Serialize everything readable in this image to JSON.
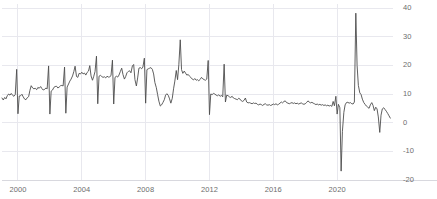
{
  "chart_data": {
    "type": "line",
    "title": "",
    "subtitle": "",
    "xlabel": "",
    "ylabel": "",
    "grid": true,
    "legend": false,
    "legend_position": "none",
    "line_color": "#4d4d4d",
    "grid_color": "#e8e8ee",
    "axis_color": "#d8d8de",
    "background_color": "#ffffff",
    "tick_label_color": "#6d6d6d",
    "ylim": [
      -20,
      40
    ],
    "yticks": [
      -20,
      -10,
      0,
      10,
      20,
      30,
      40
    ],
    "ytick_labels": [
      "-20",
      "-10",
      "0",
      "10",
      "20",
      "30",
      "40"
    ],
    "xlim": [
      1999.0,
      2023.5
    ],
    "xticks": [
      2000,
      2004,
      2008,
      2012,
      2016,
      2020
    ],
    "xtick_labels": [
      "2000",
      "2004",
      "2008",
      "2012",
      "2016",
      "2020"
    ],
    "series": [
      {
        "name": "series-1",
        "x": [
          1999.0,
          1999.08,
          1999.17,
          1999.25,
          1999.33,
          1999.42,
          1999.5,
          1999.58,
          1999.67,
          1999.75,
          1999.83,
          1999.92,
          2000.0,
          2000.08,
          2000.17,
          2000.25,
          2000.33,
          2000.42,
          2000.5,
          2000.58,
          2000.67,
          2000.75,
          2000.83,
          2000.92,
          2001.0,
          2001.08,
          2001.17,
          2001.25,
          2001.33,
          2001.42,
          2001.5,
          2001.58,
          2001.67,
          2001.75,
          2001.83,
          2001.92,
          2002.0,
          2002.08,
          2002.17,
          2002.25,
          2002.33,
          2002.42,
          2002.5,
          2002.58,
          2002.67,
          2002.75,
          2002.83,
          2002.92,
          2003.0,
          2003.08,
          2003.17,
          2003.25,
          2003.33,
          2003.42,
          2003.5,
          2003.58,
          2003.67,
          2003.75,
          2003.83,
          2003.92,
          2004.0,
          2004.08,
          2004.17,
          2004.25,
          2004.33,
          2004.42,
          2004.5,
          2004.58,
          2004.67,
          2004.75,
          2004.83,
          2004.92,
          2005.0,
          2005.08,
          2005.17,
          2005.25,
          2005.33,
          2005.42,
          2005.5,
          2005.58,
          2005.67,
          2005.75,
          2005.83,
          2005.92,
          2006.0,
          2006.08,
          2006.17,
          2006.25,
          2006.33,
          2006.42,
          2006.5,
          2006.58,
          2006.67,
          2006.75,
          2006.83,
          2006.92,
          2007.0,
          2007.08,
          2007.17,
          2007.25,
          2007.33,
          2007.42,
          2007.5,
          2007.58,
          2007.67,
          2007.75,
          2007.83,
          2007.92,
          2008.0,
          2008.08,
          2008.17,
          2008.25,
          2008.33,
          2008.42,
          2008.5,
          2008.58,
          2008.67,
          2008.75,
          2008.83,
          2008.92,
          2009.0,
          2009.08,
          2009.17,
          2009.25,
          2009.33,
          2009.42,
          2009.5,
          2009.58,
          2009.67,
          2009.75,
          2009.83,
          2009.92,
          2010.0,
          2010.08,
          2010.17,
          2010.25,
          2010.33,
          2010.42,
          2010.5,
          2010.58,
          2010.67,
          2010.75,
          2010.83,
          2010.92,
          2011.0,
          2011.08,
          2011.17,
          2011.25,
          2011.33,
          2011.42,
          2011.5,
          2011.58,
          2011.67,
          2011.75,
          2011.83,
          2011.92,
          2012.0,
          2012.08,
          2012.17,
          2012.25,
          2012.33,
          2012.42,
          2012.5,
          2012.58,
          2012.67,
          2012.75,
          2012.83,
          2012.92,
          2013.0,
          2013.08,
          2013.17,
          2013.25,
          2013.33,
          2013.42,
          2013.5,
          2013.58,
          2013.67,
          2013.75,
          2013.83,
          2013.92,
          2014.0,
          2014.08,
          2014.17,
          2014.25,
          2014.33,
          2014.42,
          2014.5,
          2014.58,
          2014.67,
          2014.75,
          2014.83,
          2014.92,
          2015.0,
          2015.08,
          2015.17,
          2015.25,
          2015.33,
          2015.42,
          2015.5,
          2015.58,
          2015.67,
          2015.75,
          2015.83,
          2015.92,
          2016.0,
          2016.08,
          2016.17,
          2016.25,
          2016.33,
          2016.42,
          2016.5,
          2016.58,
          2016.67,
          2016.75,
          2016.83,
          2016.92,
          2017.0,
          2017.08,
          2017.17,
          2017.25,
          2017.33,
          2017.42,
          2017.5,
          2017.58,
          2017.67,
          2017.75,
          2017.83,
          2017.92,
          2018.0,
          2018.08,
          2018.17,
          2018.25,
          2018.33,
          2018.42,
          2018.5,
          2018.58,
          2018.67,
          2018.75,
          2018.83,
          2018.92,
          2019.0,
          2019.08,
          2019.17,
          2019.25,
          2019.33,
          2019.42,
          2019.5,
          2019.58,
          2019.67,
          2019.75,
          2019.83,
          2019.92,
          2020.0,
          2020.08,
          2020.17,
          2020.25,
          2020.33,
          2020.42,
          2020.5,
          2020.58,
          2020.67,
          2020.75,
          2020.83,
          2020.92,
          2021.0,
          2021.08,
          2021.17,
          2021.25,
          2021.33,
          2021.42,
          2021.5,
          2021.58,
          2021.67,
          2021.75,
          2021.83,
          2021.92,
          2022.0,
          2022.08,
          2022.17,
          2022.25,
          2022.33,
          2022.42,
          2022.5,
          2022.58,
          2022.67,
          2022.75,
          2022.83,
          2022.92,
          2023.0,
          2023.08,
          2023.17,
          2023.25,
          2023.33
        ],
        "values": [
          8.6,
          7.9,
          8.8,
          8.3,
          9.4,
          10.0,
          9.6,
          10.2,
          9.5,
          9.2,
          9.8,
          18.6,
          3.1,
          9.3,
          9.4,
          9.9,
          9.0,
          8.2,
          8.0,
          8.7,
          9.1,
          11.3,
          12.9,
          12.1,
          11.8,
          12.0,
          11.5,
          12.3,
          12.0,
          12.6,
          11.9,
          11.4,
          11.6,
          12.1,
          11.8,
          19.8,
          3.0,
          11.0,
          11.4,
          12.3,
          12.6,
          12.7,
          12.1,
          12.4,
          12.9,
          13.0,
          12.8,
          19.4,
          3.3,
          12.4,
          13.5,
          14.5,
          15.2,
          16.3,
          17.8,
          19.7,
          16.1,
          15.8,
          17.2,
          17.0,
          17.6,
          17.0,
          17.3,
          16.6,
          17.5,
          18.0,
          19.9,
          16.3,
          14.8,
          16.2,
          17.8,
          23.2,
          6.6,
          16.2,
          16.5,
          16.1,
          15.8,
          16.0,
          15.6,
          16.2,
          15.9,
          16.0,
          16.4,
          21.8,
          6.5,
          15.8,
          16.2,
          15.9,
          16.6,
          17.9,
          19.0,
          16.8,
          15.2,
          16.1,
          17.4,
          17.9,
          18.1,
          17.4,
          19.8,
          20.3,
          15.0,
          12.8,
          15.6,
          19.0,
          19.2,
          18.8,
          19.4,
          22.5,
          6.8,
          18.5,
          18.8,
          19.0,
          19.2,
          18.6,
          17.0,
          14.0,
          12.2,
          9.8,
          7.5,
          5.8,
          6.2,
          7.0,
          8.0,
          9.6,
          10.1,
          9.5,
          8.3,
          6.8,
          8.5,
          11.8,
          14.5,
          18.2,
          15.0,
          20.2,
          28.9,
          18.5,
          17.2,
          18.0,
          17.3,
          16.6,
          16.8,
          16.2,
          15.8,
          15.2,
          14.9,
          15.4,
          14.8,
          15.0,
          14.6,
          15.1,
          15.8,
          15.3,
          15.0,
          14.8,
          15.2,
          21.7,
          2.8,
          10.0,
          9.8,
          10.2,
          10.0,
          9.6,
          9.4,
          9.7,
          9.2,
          9.5,
          9.0,
          20.4,
          7.2,
          9.6,
          9.4,
          9.0,
          8.8,
          9.2,
          8.6,
          8.4,
          8.2,
          8.0,
          8.5,
          8.2,
          7.6,
          7.4,
          7.8,
          8.6,
          7.2,
          6.9,
          7.0,
          6.8,
          6.6,
          6.9,
          6.7,
          6.8,
          6.4,
          6.2,
          6.5,
          6.3,
          6.0,
          6.4,
          6.6,
          6.2,
          6.1,
          6.3,
          6.0,
          6.2,
          6.5,
          6.3,
          6.6,
          6.2,
          6.4,
          6.8,
          7.2,
          6.9,
          7.4,
          7.6,
          7.0,
          6.8,
          6.6,
          6.8,
          7.0,
          6.7,
          6.9,
          6.6,
          6.8,
          6.5,
          6.7,
          6.9,
          6.6,
          6.4,
          6.6,
          7.0,
          7.6,
          7.2,
          6.9,
          7.1,
          6.8,
          6.6,
          6.3,
          6.5,
          6.2,
          6.4,
          6.1,
          6.3,
          6.0,
          6.2,
          5.9,
          6.1,
          5.8,
          6.0,
          5.7,
          7.4,
          5.9,
          9.2,
          3.0,
          6.4,
          5.2,
          -16.9,
          -3.0,
          3.6,
          6.2,
          7.0,
          7.1,
          6.8,
          7.0,
          6.6,
          6.5,
          7.2,
          38.2,
          20.0,
          13.0,
          10.4,
          9.8,
          8.2,
          7.0,
          6.4,
          5.8,
          5.4,
          5.0,
          6.2,
          7.0,
          6.0,
          4.2,
          5.4,
          4.8,
          2.0,
          -3.4,
          2.6,
          4.8,
          5.2,
          4.6,
          4.0,
          3.2,
          2.4,
          1.6
        ]
      }
    ]
  }
}
